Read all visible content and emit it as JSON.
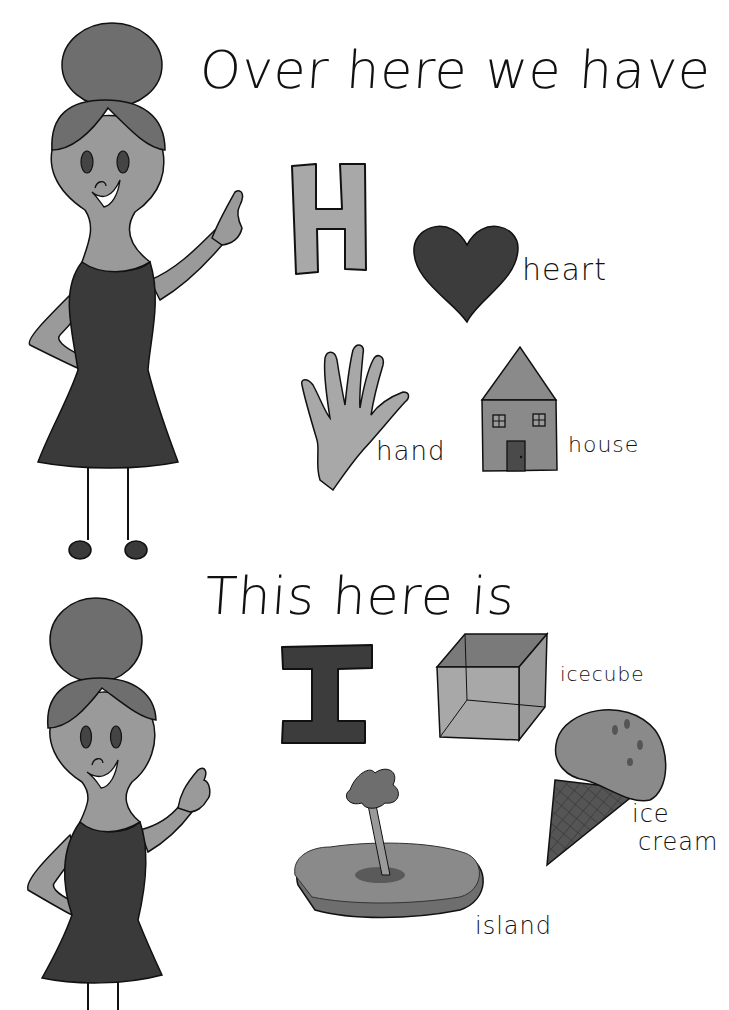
{
  "page": {
    "colors": {
      "background": "#ffffff",
      "skin": "#9a9a9a",
      "hair": "#6e6e6e",
      "dress": "#3a3a3a",
      "light_gray": "#a8a8a8",
      "mid_gray": "#8a8a8a",
      "dark_gray": "#3c3c3c",
      "outline": "#111111"
    }
  },
  "section_h": {
    "heading": "Over here we have",
    "letter": "H",
    "items": [
      {
        "name": "heart",
        "label": "heart"
      },
      {
        "name": "hand",
        "label": "hand"
      },
      {
        "name": "house",
        "label": "house"
      }
    ]
  },
  "section_i": {
    "heading": "This here is",
    "letter": "I",
    "items": [
      {
        "name": "icecube",
        "label": "icecube"
      },
      {
        "name": "ice-cream",
        "label_line1": "ice",
        "label_line2": "cream"
      },
      {
        "name": "island",
        "label": "island"
      }
    ]
  }
}
